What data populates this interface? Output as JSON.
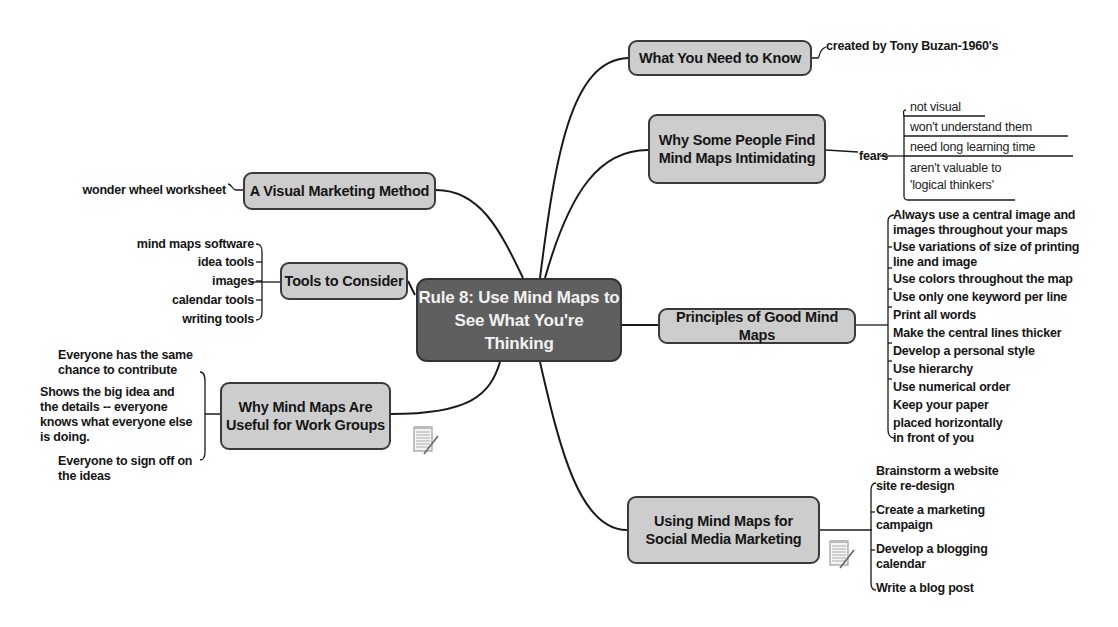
{
  "central": {
    "title_line1": "Rule 8: Use Mind Maps to",
    "title_line2": "See What You're Thinking"
  },
  "branches": {
    "what_to_know": {
      "label": "What You Need to Know",
      "children": [
        "created by Tony Buzan-1960's"
      ]
    },
    "intimidating": {
      "label_line1": "Why Some People Find",
      "label_line2": "Mind Maps Intimidating",
      "connector_label": "fears",
      "children": [
        "not visual",
        "won't understand them",
        "need long learning time",
        "aren't valuable to",
        "'logical thinkers'"
      ]
    },
    "visual_method": {
      "label": "A Visual Marketing Method",
      "children": [
        "wonder wheel worksheet"
      ]
    },
    "tools": {
      "label": "Tools to Consider",
      "children": [
        "mind maps software",
        "idea tools",
        "images",
        "calendar tools",
        "writing tools"
      ]
    },
    "work_groups": {
      "label_line1": "Why Mind Maps Are",
      "label_line2": "Useful for Work Groups",
      "children": [
        [
          "Everyone has the same",
          "chance to contribute"
        ],
        [
          "Shows the big idea and",
          "the details -- everyone",
          "knows what everyone else",
          "is doing."
        ],
        [
          "Everyone to sign off on",
          "the ideas"
        ]
      ],
      "attachment_icon": "notepad-icon"
    },
    "principles": {
      "label": "Principles of Good Mind Maps",
      "children": [
        "Always use a central image and",
        "images throughout your maps",
        "Use variations of size of printing",
        "line and image",
        "Use colors throughout the map",
        "Use only one keyword per line",
        "Print all words",
        "Make the central lines thicker",
        "Develop a personal style",
        "Use hierarchy",
        "Use numerical order",
        "Keep your paper",
        "placed horizontally",
        "in front of you"
      ]
    },
    "social_media": {
      "label_line1": "Using Mind Maps for",
      "label_line2": "Social Media Marketing",
      "children": [
        "Brainstorm a website",
        "site re-design",
        "Create a marketing",
        "campaign",
        "Develop a blogging",
        "calendar",
        "Write a blog post"
      ],
      "attachment_icon": "notepad-icon"
    }
  },
  "colors": {
    "central_fill": "#5f5f5f",
    "node_fill": "#cdcdcd",
    "line": "#1a1a1a",
    "background": "#ffffff"
  }
}
